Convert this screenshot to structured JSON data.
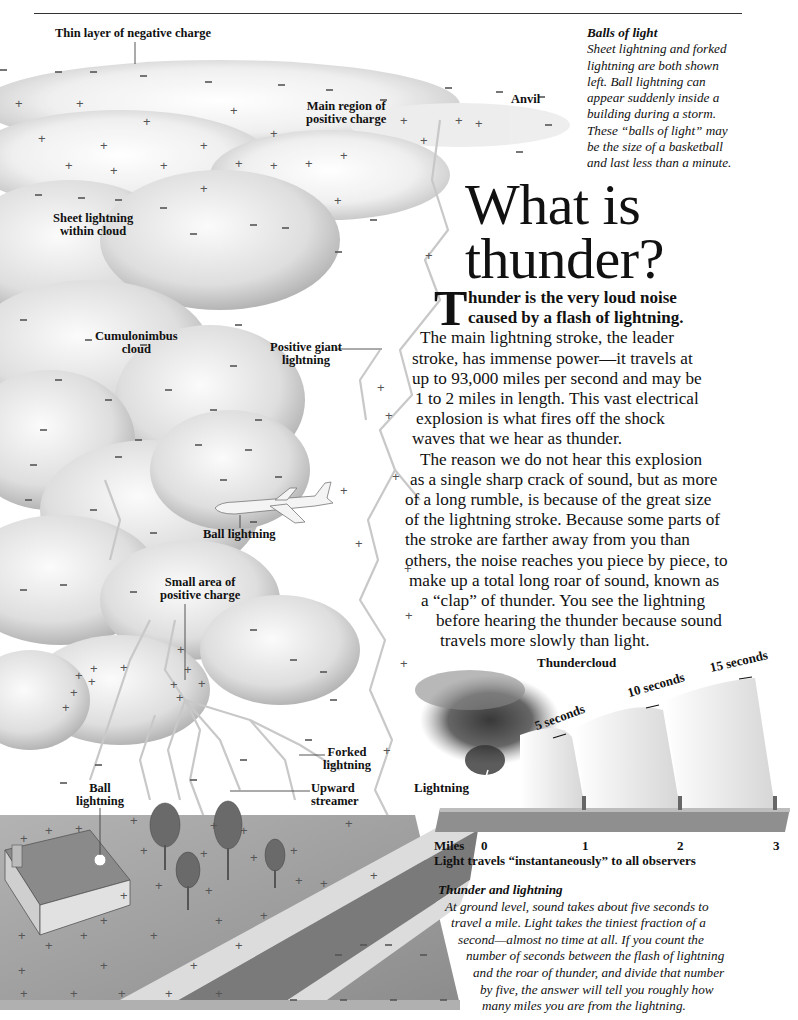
{
  "page": {
    "headline_line1": "What is",
    "headline_line2": "thunder?"
  },
  "labels": {
    "thin_layer": "Thin layer of negative charge",
    "main_region_1": "Main region of",
    "main_region_2": "positive charge",
    "anvil": "Anvil",
    "sheet_lightning_1": "Sheet lightning",
    "sheet_lightning_2": "within cloud",
    "cumulonimbus_1": "Cumulonimbus",
    "cumulonimbus_2": "cloud",
    "positive_giant_1": "Positive giant",
    "positive_giant_2": "lightning",
    "ball_lightning_plane": "Ball lightning",
    "small_area_1": "Small area of",
    "small_area_2": "positive charge",
    "forked_1": "Forked",
    "forked_2": "lightning",
    "upward_1": "Upward",
    "upward_2": "streamer",
    "ball_house_1": "Ball",
    "ball_house_2": "lightning"
  },
  "sidebar_note": {
    "title": "Balls of light",
    "lines": [
      "Sheet lightning and forked",
      "lightning are both shown",
      "left. Ball lightning can",
      "appear suddenly inside a",
      "building during a storm.",
      "These “balls of light” may",
      "be the size of a basketball",
      "and last less than a minute."
    ]
  },
  "body": {
    "dropcap": "T",
    "intro": [
      "hunder is the very loud noise",
      "caused by a flash of lightning."
    ],
    "paragraph1": [
      "The main lightning stroke, the leader",
      "stroke, has immense power—it travels at",
      "up to 93,000 miles per second and may be",
      "1 to 2 miles in length. This vast electrical",
      "explosion is what fires off the shock",
      "waves that we hear as thunder."
    ],
    "paragraph2": [
      "The reason we do not hear this explosion",
      "as a single sharp crack of sound, but as more",
      "of a long rumble, is because of the great size",
      "of the lightning stroke. Because some parts of",
      "the stroke are farther away from you than",
      "others, the noise reaches you piece by piece, to",
      "make up a total long roar of sound, known as",
      "a “clap” of thunder. You see the lightning",
      "before hearing the thunder because sound",
      "travels more slowly than light."
    ]
  },
  "diagram": {
    "thundercloud": "Thundercloud",
    "lightning": "Lightning",
    "seconds": [
      "5 seconds",
      "10 seconds",
      "15 seconds"
    ],
    "miles_label": "Miles",
    "miles": [
      "0",
      "1",
      "2",
      "3"
    ],
    "light_note": "Light travels “instantaneously” to all observers"
  },
  "caption": {
    "title": "Thunder and lightning",
    "lines": [
      "At ground level, sound takes about five seconds to",
      "travel a mile. Light takes the tiniest fraction of a",
      "second—almost no time at all. If you count the",
      "number of seconds between the flash of lightning",
      "and the roar of thunder, and divide that number",
      "by five, the answer will tell you roughly how",
      "many miles you are from the lightning."
    ]
  },
  "colors": {
    "text": "#111111",
    "cloud_light": "#f2f2f2",
    "cloud_shadow": "#bdbdbd",
    "ground": "#9a9a9a",
    "road": "#7d7d7d",
    "lightning": "#c8c8c8"
  }
}
